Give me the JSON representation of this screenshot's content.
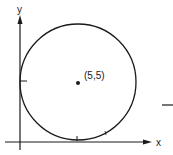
{
  "diagram": {
    "type": "circle-tangent-to-axes",
    "axes": {
      "x_label": "x",
      "y_label": "y"
    },
    "circle": {
      "center_label": "(5,5)",
      "center": [
        5,
        5
      ],
      "radius": 5
    },
    "colors": {
      "stroke": "#1a1a1a",
      "background": "#ffffff"
    }
  }
}
